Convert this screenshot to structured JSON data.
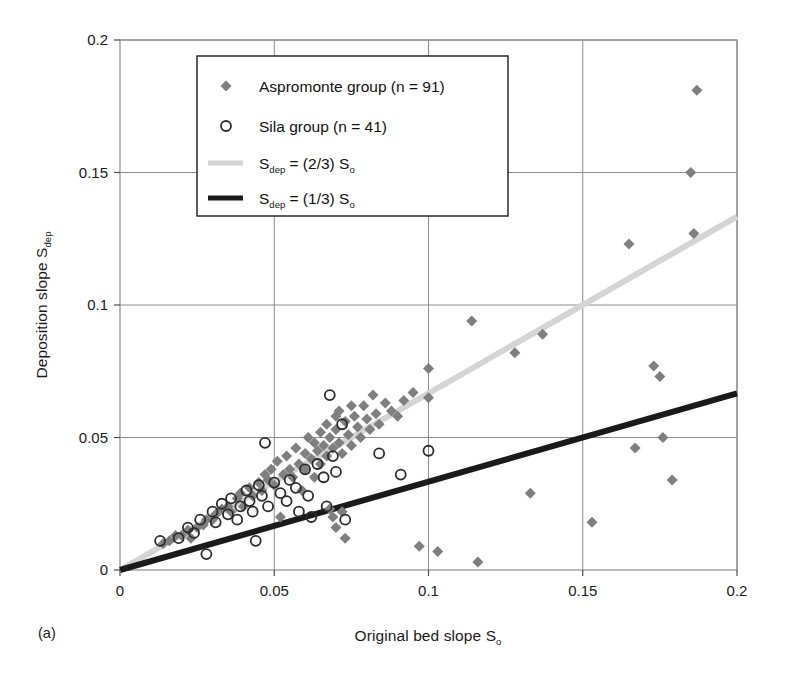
{
  "figure": {
    "panel_label": "(a)",
    "background_color": "#ffffff"
  },
  "chart_data": {
    "type": "scatter",
    "title": "",
    "xlabel": "Original bed slope S",
    "xlabel_sub": "o",
    "ylabel": "Deposition slope S",
    "ylabel_sub": "dep",
    "xlim": [
      0,
      0.2
    ],
    "ylim": [
      0,
      0.2
    ],
    "xticks": [
      0,
      0.05,
      0.1,
      0.15,
      0.2
    ],
    "xtick_labels": [
      "0",
      "0.05",
      "0.1",
      "0.15",
      "0.2"
    ],
    "yticks": [
      0,
      0.05,
      0.1,
      0.15,
      0.2
    ],
    "ytick_labels": [
      "0",
      "0.05",
      "0.1",
      "0.15",
      "0.2"
    ],
    "grid": true,
    "grid_color": "#8c8c8c",
    "frame_color": "#8c8c8c",
    "legend_position": "top-left-inside",
    "legend_border_color": "#1a1a1a",
    "series": [
      {
        "name": "Aspromonte group (n = 91)",
        "marker": "diamond",
        "marker_color": "#7f7f7f",
        "marker_size": 11,
        "n": 91,
        "points": [
          [
            0.014,
            0.01
          ],
          [
            0.016,
            0.011
          ],
          [
            0.018,
            0.013
          ],
          [
            0.02,
            0.013
          ],
          [
            0.022,
            0.015
          ],
          [
            0.023,
            0.012
          ],
          [
            0.025,
            0.016
          ],
          [
            0.027,
            0.017
          ],
          [
            0.028,
            0.019
          ],
          [
            0.03,
            0.019
          ],
          [
            0.031,
            0.021
          ],
          [
            0.033,
            0.023
          ],
          [
            0.035,
            0.024
          ],
          [
            0.036,
            0.022
          ],
          [
            0.038,
            0.027
          ],
          [
            0.039,
            0.029
          ],
          [
            0.04,
            0.024
          ],
          [
            0.042,
            0.031
          ],
          [
            0.043,
            0.028
          ],
          [
            0.045,
            0.033
          ],
          [
            0.046,
            0.03
          ],
          [
            0.047,
            0.036
          ],
          [
            0.048,
            0.034
          ],
          [
            0.049,
            0.038
          ],
          [
            0.05,
            0.032
          ],
          [
            0.051,
            0.041
          ],
          [
            0.052,
            0.02
          ],
          [
            0.053,
            0.036
          ],
          [
            0.054,
            0.043
          ],
          [
            0.055,
            0.038
          ],
          [
            0.056,
            0.035
          ],
          [
            0.057,
            0.046
          ],
          [
            0.058,
            0.04
          ],
          [
            0.059,
            0.03
          ],
          [
            0.06,
            0.044
          ],
          [
            0.06,
            0.038
          ],
          [
            0.061,
            0.05
          ],
          [
            0.062,
            0.042
          ],
          [
            0.063,
            0.035
          ],
          [
            0.063,
            0.048
          ],
          [
            0.064,
            0.045
          ],
          [
            0.065,
            0.052
          ],
          [
            0.065,
            0.04
          ],
          [
            0.066,
            0.047
          ],
          [
            0.067,
            0.055
          ],
          [
            0.067,
            0.043
          ],
          [
            0.068,
            0.05
          ],
          [
            0.068,
            0.023
          ],
          [
            0.069,
            0.046
          ],
          [
            0.069,
            0.02
          ],
          [
            0.07,
            0.058
          ],
          [
            0.07,
            0.053
          ],
          [
            0.07,
            0.016
          ],
          [
            0.071,
            0.048
          ],
          [
            0.071,
            0.06
          ],
          [
            0.072,
            0.044
          ],
          [
            0.072,
            0.022
          ],
          [
            0.073,
            0.056
          ],
          [
            0.073,
            0.012
          ],
          [
            0.074,
            0.051
          ],
          [
            0.075,
            0.062
          ],
          [
            0.075,
            0.047
          ],
          [
            0.076,
            0.058
          ],
          [
            0.077,
            0.054
          ],
          [
            0.078,
            0.05
          ],
          [
            0.079,
            0.062
          ],
          [
            0.08,
            0.057
          ],
          [
            0.081,
            0.053
          ],
          [
            0.082,
            0.066
          ],
          [
            0.083,
            0.059
          ],
          [
            0.084,
            0.055
          ],
          [
            0.086,
            0.063
          ],
          [
            0.088,
            0.06
          ],
          [
            0.09,
            0.058
          ],
          [
            0.092,
            0.064
          ],
          [
            0.095,
            0.067
          ],
          [
            0.097,
            0.009
          ],
          [
            0.1,
            0.065
          ],
          [
            0.1,
            0.076
          ],
          [
            0.103,
            0.007
          ],
          [
            0.114,
            0.094
          ],
          [
            0.116,
            0.003
          ],
          [
            0.128,
            0.082
          ],
          [
            0.133,
            0.029
          ],
          [
            0.137,
            0.089
          ],
          [
            0.153,
            0.018
          ],
          [
            0.165,
            0.123
          ],
          [
            0.167,
            0.046
          ],
          [
            0.173,
            0.077
          ],
          [
            0.175,
            0.073
          ],
          [
            0.176,
            0.05
          ],
          [
            0.179,
            0.034
          ],
          [
            0.185,
            0.15
          ],
          [
            0.186,
            0.127
          ],
          [
            0.187,
            0.181
          ]
        ]
      },
      {
        "name": "Sila group (n = 41)",
        "marker": "circle-open",
        "marker_color": "#2b2b2b",
        "marker_size": 10,
        "n": 41,
        "points": [
          [
            0.013,
            0.011
          ],
          [
            0.019,
            0.012
          ],
          [
            0.022,
            0.016
          ],
          [
            0.024,
            0.014
          ],
          [
            0.026,
            0.019
          ],
          [
            0.028,
            0.006
          ],
          [
            0.03,
            0.022
          ],
          [
            0.031,
            0.018
          ],
          [
            0.033,
            0.025
          ],
          [
            0.035,
            0.021
          ],
          [
            0.036,
            0.027
          ],
          [
            0.038,
            0.019
          ],
          [
            0.039,
            0.024
          ],
          [
            0.041,
            0.03
          ],
          [
            0.042,
            0.026
          ],
          [
            0.043,
            0.022
          ],
          [
            0.044,
            0.011
          ],
          [
            0.045,
            0.032
          ],
          [
            0.046,
            0.028
          ],
          [
            0.047,
            0.048
          ],
          [
            0.048,
            0.024
          ],
          [
            0.05,
            0.033
          ],
          [
            0.052,
            0.029
          ],
          [
            0.054,
            0.026
          ],
          [
            0.055,
            0.034
          ],
          [
            0.057,
            0.031
          ],
          [
            0.058,
            0.022
          ],
          [
            0.06,
            0.038
          ],
          [
            0.061,
            0.028
          ],
          [
            0.062,
            0.02
          ],
          [
            0.064,
            0.04
          ],
          [
            0.066,
            0.035
          ],
          [
            0.067,
            0.024
          ],
          [
            0.068,
            0.066
          ],
          [
            0.069,
            0.043
          ],
          [
            0.07,
            0.037
          ],
          [
            0.072,
            0.055
          ],
          [
            0.073,
            0.019
          ],
          [
            0.084,
            0.044
          ],
          [
            0.091,
            0.036
          ],
          [
            0.1,
            0.045
          ]
        ]
      }
    ],
    "lines": [
      {
        "name": "S_dep = (2/3) S_o",
        "label": "S",
        "label_sub": "dep",
        "label_rest": " = (2/3) S",
        "label_rest_sub": "o",
        "slope": 0.6667,
        "intercept": 0,
        "color": "#d4d4d4",
        "width": 6,
        "x_range": [
          0,
          0.2
        ]
      },
      {
        "name": "S_dep = (1/3) S_o",
        "label": "S",
        "label_sub": "dep",
        "label_rest": " = (1/3) S",
        "label_rest_sub": "o",
        "slope": 0.3333,
        "intercept": 0,
        "color": "#1a1a1a",
        "width": 6,
        "x_range": [
          0,
          0.2
        ]
      }
    ],
    "legend_entries": [
      {
        "type": "marker-diamond",
        "label": "Aspromonte group (n = 91)"
      },
      {
        "type": "marker-circle",
        "label": "Sila group (n = 41)"
      },
      {
        "type": "line-light",
        "label": "S",
        "sub": "dep",
        "rest": " = (2/3) S",
        "rest_sub": "o"
      },
      {
        "type": "line-dark",
        "label": "S",
        "sub": "dep",
        "rest": " = (1/3) S",
        "rest_sub": "o"
      }
    ]
  }
}
